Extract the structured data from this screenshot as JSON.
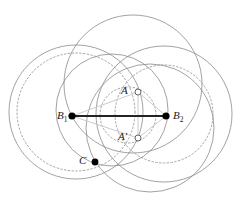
{
  "figure": {
    "type": "geometric-circle-diagram",
    "width": 242,
    "height": 220,
    "background": "#ffffff",
    "stroke_circle": "#8a8a8a",
    "stroke_dotted": "#9a9a9a",
    "stroke_connector": "#cccccc",
    "stroke_segment": "#222222",
    "point_fill": "#000000",
    "point_open_fill": "#ffffff"
  },
  "labels": {
    "b1": {
      "base": "B",
      "sub": "1"
    },
    "b2": {
      "base": "B",
      "sub": "2"
    },
    "a": {
      "base": "A",
      "sub": ""
    },
    "a_prime": {
      "base": "A′",
      "sub": ""
    },
    "c": {
      "base": "C",
      "sub": ""
    }
  },
  "points": [
    {
      "id": "B1",
      "name": "point-b1",
      "x": 72,
      "y": 116,
      "marker": "filled",
      "r": 3.6
    },
    {
      "id": "B2",
      "name": "point-b2",
      "x": 166,
      "y": 116,
      "marker": "filled",
      "r": 3.6
    },
    {
      "id": "A",
      "name": "point-a",
      "x": 138,
      "y": 92,
      "marker": "open",
      "r": 3.0
    },
    {
      "id": "A'",
      "name": "point-a-prime",
      "x": 138,
      "y": 138,
      "marker": "open",
      "r": 3.0
    },
    {
      "id": "C",
      "name": "point-c",
      "x": 95,
      "y": 162,
      "marker": "filled",
      "r": 3.4
    }
  ],
  "circles": [
    {
      "id": "c1",
      "name": "circle-large-left",
      "cx": 76,
      "cy": 112,
      "r": 67,
      "style": "solid"
    },
    {
      "id": "c2",
      "name": "circle-dotted-left",
      "cx": 76,
      "cy": 112,
      "r": 59,
      "style": "dotted"
    },
    {
      "id": "c3",
      "name": "circle-large-top",
      "cx": 133,
      "cy": 84,
      "r": 69,
      "style": "solid"
    },
    {
      "id": "c4",
      "name": "circle-large-right",
      "cx": 164,
      "cy": 114,
      "r": 68,
      "style": "solid"
    },
    {
      "id": "c5",
      "name": "circle-dotted-right",
      "cx": 164,
      "cy": 114,
      "r": 49,
      "style": "dotted"
    },
    {
      "id": "c6",
      "name": "circle-mid-left",
      "cx": 112,
      "cy": 110,
      "r": 56,
      "style": "solid"
    },
    {
      "id": "c7",
      "name": "circle-dotted-center",
      "cx": 128,
      "cy": 115,
      "r": 28,
      "style": "dotted"
    },
    {
      "id": "c8",
      "name": "circle-lower-right",
      "cx": 150,
      "cy": 128,
      "r": 64,
      "style": "solid"
    }
  ],
  "segments": [
    {
      "id": "s1",
      "name": "segment-b1-b2",
      "x1": 72,
      "y1": 116,
      "x2": 166,
      "y2": 116,
      "style": "bold"
    }
  ],
  "connectors": [
    {
      "id": "n1",
      "name": "connector-b1-a",
      "x1": 72,
      "y1": 116,
      "x2": 138,
      "y2": 92
    },
    {
      "id": "n2",
      "name": "connector-b1-a-prime",
      "x1": 72,
      "y1": 116,
      "x2": 138,
      "y2": 138
    },
    {
      "id": "n3",
      "name": "connector-b2-a",
      "x1": 166,
      "y1": 116,
      "x2": 138,
      "y2": 92
    },
    {
      "id": "n4",
      "name": "connector-b2-a-prime",
      "x1": 166,
      "y1": 116,
      "x2": 138,
      "y2": 138
    },
    {
      "id": "n5",
      "name": "connector-a-a-prime",
      "x1": 138,
      "y1": 92,
      "x2": 138,
      "y2": 138
    }
  ],
  "label_positions": {
    "b1": {
      "x": 57,
      "y": 110
    },
    "b2": {
      "x": 173,
      "y": 110
    },
    "a": {
      "x": 121,
      "y": 85
    },
    "a_prime": {
      "x": 118,
      "y": 131
    },
    "c": {
      "x": 79,
      "y": 155
    }
  }
}
